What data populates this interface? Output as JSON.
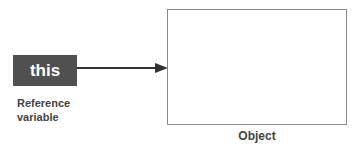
{
  "diagram": {
    "reference": {
      "label": "this",
      "caption_line1": "Reference",
      "caption_line2": "variable",
      "fill_color": "#505050",
      "text_color": "#ffffff"
    },
    "arrow": {
      "from": "reference",
      "to": "object",
      "color": "#333333"
    },
    "object": {
      "caption": "Object",
      "border_color": "#8a8a8a"
    }
  }
}
